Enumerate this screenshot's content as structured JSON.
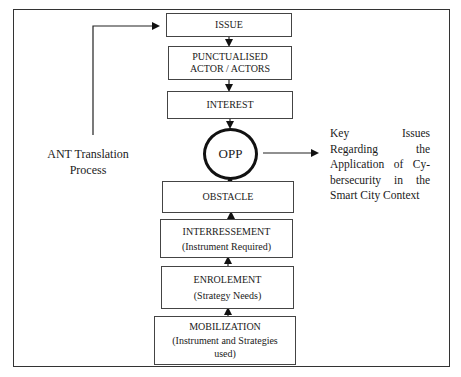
{
  "diagram": {
    "title": "ANT Translation Process",
    "left_label": [
      "ANT Translation",
      "Process"
    ],
    "steps_top_down": [
      {
        "id": "issue",
        "label": "ISSUE"
      },
      {
        "id": "punctualised",
        "label": "PUNCTUALISED",
        "label2": "ACTOR / ACTORS"
      },
      {
        "id": "interest",
        "label": "INTEREST"
      }
    ],
    "center": {
      "id": "opp",
      "label": "OPP"
    },
    "steps_bottom_up": [
      {
        "id": "obstacle",
        "label": "OBSTACLE"
      },
      {
        "id": "interressement",
        "label": "INTERRESSEMENT",
        "sub": "(Instrument Required)"
      },
      {
        "id": "enrolement",
        "label": "ENROLEMENT",
        "sub": "(Strategy Needs)"
      },
      {
        "id": "mobilization",
        "label": "MOBILIZATION",
        "sub": "(Instrument and Strategies used)"
      }
    ],
    "output_note": "Key Issues Regarding the Application of Cy-bersecurity in the Smart City Context",
    "edges": [
      {
        "from": "issue",
        "to": "punctualised"
      },
      {
        "from": "punctualised",
        "to": "interest"
      },
      {
        "from": "interest",
        "to": "opp"
      },
      {
        "from": "obstacle",
        "to": "opp"
      },
      {
        "from": "interressement",
        "to": "obstacle"
      },
      {
        "from": "enrolement",
        "to": "interressement"
      },
      {
        "from": "mobilization",
        "to": "enrolement"
      },
      {
        "from": "opp",
        "to": "output_note"
      },
      {
        "from": "ant_translation_process",
        "to": "issue"
      }
    ]
  }
}
